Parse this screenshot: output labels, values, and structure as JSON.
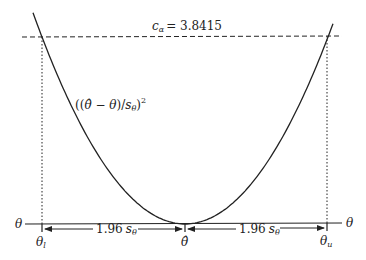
{
  "diagram": {
    "type": "confidence-interval-parabola",
    "threshold_label": "c",
    "threshold_subscript": "α",
    "threshold_value_text": "= 3.8415",
    "threshold_value": 3.8415,
    "curve_label": {
      "open": "((",
      "theta_hat": "θ̂",
      "minus": " − ",
      "theta": "θ",
      "close_div": ")/",
      "s": "s",
      "s_sub": "θ",
      "close": ")",
      "power": "2"
    },
    "axis_label_left": "θ",
    "axis_label_right": "θ",
    "lower_bound": {
      "symbol": "θ",
      "subscript": "l"
    },
    "center": {
      "symbol": "θ̂"
    },
    "upper_bound": {
      "symbol": "θ",
      "subscript": "u"
    },
    "left_interval": {
      "factor": "1.96",
      "s": "s",
      "s_sub": "θ"
    },
    "right_interval": {
      "factor": "1.96",
      "s": "s",
      "s_sub": "θ"
    },
    "colors": {
      "stroke": "#222222",
      "background": "#ffffff"
    }
  }
}
